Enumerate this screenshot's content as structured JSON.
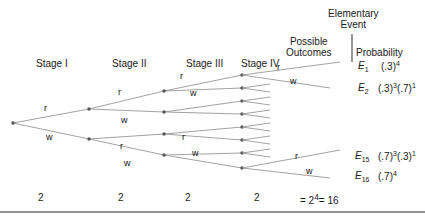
{
  "figure": {
    "type": "probability-tree-diagram"
  },
  "stage_headers": [
    {
      "label": "Stage I",
      "x": 36,
      "y": 58
    },
    {
      "label": "Stage II",
      "x": 112,
      "y": 58
    },
    {
      "label": "Stage III",
      "x": 186,
      "y": 58
    },
    {
      "label": "Stage IV",
      "x": 241,
      "y": 58
    }
  ],
  "column_headers": [
    {
      "id": "possible-outcomes",
      "line1": "Possible",
      "line2": "Outcomes",
      "x": 292,
      "y": 36
    },
    {
      "id": "elementary-event",
      "line1": "Elementary",
      "line2": "Event",
      "x": 355,
      "y": 8
    },
    {
      "id": "probability",
      "line1": "Probability",
      "line2": "",
      "x": 355,
      "y": 47
    }
  ],
  "divider": {
    "x": 352,
    "y1": 34,
    "y2": 62
  },
  "bottom_rule": {
    "y": 212
  },
  "branch_labels": [
    {
      "text": "r",
      "x": 44,
      "y": 108
    },
    {
      "text": "w",
      "x": 46,
      "y": 137
    },
    {
      "text": "r",
      "x": 118,
      "y": 92
    },
    {
      "text": "w",
      "x": 121,
      "y": 120
    },
    {
      "text": "r",
      "x": 120,
      "y": 146
    },
    {
      "text": "w",
      "x": 124,
      "y": 163
    },
    {
      "text": "r",
      "x": 180,
      "y": 76
    },
    {
      "text": "w",
      "x": 190,
      "y": 93
    },
    {
      "text": "r",
      "x": 182,
      "y": 137
    },
    {
      "text": "w",
      "x": 192,
      "y": 153
    },
    {
      "text": "r",
      "x": 277,
      "y": 68
    },
    {
      "text": "w",
      "x": 290,
      "y": 82
    },
    {
      "text": "r",
      "x": 295,
      "y": 156
    },
    {
      "text": "w",
      "x": 306,
      "y": 171
    }
  ],
  "stage_counts": [
    {
      "value": "2",
      "x": 38,
      "y": 195
    },
    {
      "value": "2",
      "x": 118,
      "y": 195
    },
    {
      "value": "2",
      "x": 185,
      "y": 195
    },
    {
      "value": "2",
      "x": 254,
      "y": 195
    }
  ],
  "total": {
    "prefix": "= 2",
    "exp": "4",
    "suffix": "= 16",
    "x": 300,
    "y": 195
  },
  "outcomes": [
    {
      "event": "E",
      "index": "1",
      "prob_base1": "(.3)",
      "prob_exp1": "4",
      "prob_base2": "",
      "prob_exp2": "",
      "y": 63
    },
    {
      "event": "E",
      "index": "2",
      "prob_base1": "(.3)",
      "prob_exp1": "3",
      "prob_base2": "(.7)",
      "prob_exp2": "1",
      "y": 85
    },
    {
      "event": "E",
      "index": "15",
      "prob_base1": "(.7)",
      "prob_exp1": "3",
      "prob_base2": "(.3)",
      "prob_exp2": "1",
      "y": 153
    },
    {
      "event": "E",
      "index": "16",
      "prob_base1": "(.7)",
      "prob_exp1": "4",
      "prob_base2": "",
      "prob_exp2": "",
      "y": 173
    }
  ],
  "tree": {
    "root": {
      "x": 13,
      "y": 123
    },
    "stage2_nodes": [
      {
        "x": 89,
        "y": 109
      },
      {
        "x": 89,
        "y": 139
      }
    ],
    "stage3_nodes": [
      {
        "x": 164,
        "y": 91
      },
      {
        "x": 164,
        "y": 112
      },
      {
        "x": 164,
        "y": 134
      },
      {
        "x": 164,
        "y": 155
      }
    ],
    "stage4_nodes": [
      {
        "x": 242,
        "y": 75
      },
      {
        "x": 242,
        "y": 88
      },
      {
        "x": 242,
        "y": 101
      },
      {
        "x": 242,
        "y": 114
      },
      {
        "x": 242,
        "y": 127
      },
      {
        "x": 242,
        "y": 140
      },
      {
        "x": 242,
        "y": 153
      },
      {
        "x": 242,
        "y": 168
      }
    ],
    "leaf_fans_labeled": [
      {
        "node": 0,
        "up": {
          "x": 340,
          "y": 62
        },
        "down": {
          "x": 330,
          "y": 88
        }
      },
      {
        "node": 7,
        "node_y": 168,
        "up": {
          "x": 340,
          "y": 150
        },
        "down": {
          "x": 330,
          "y": 178
        }
      }
    ],
    "leaf_stub_x": 270,
    "stub_spread": 4,
    "line_color": "#8a8a8a",
    "node_color": "#555555",
    "rule_color": "#6e6e6e"
  }
}
